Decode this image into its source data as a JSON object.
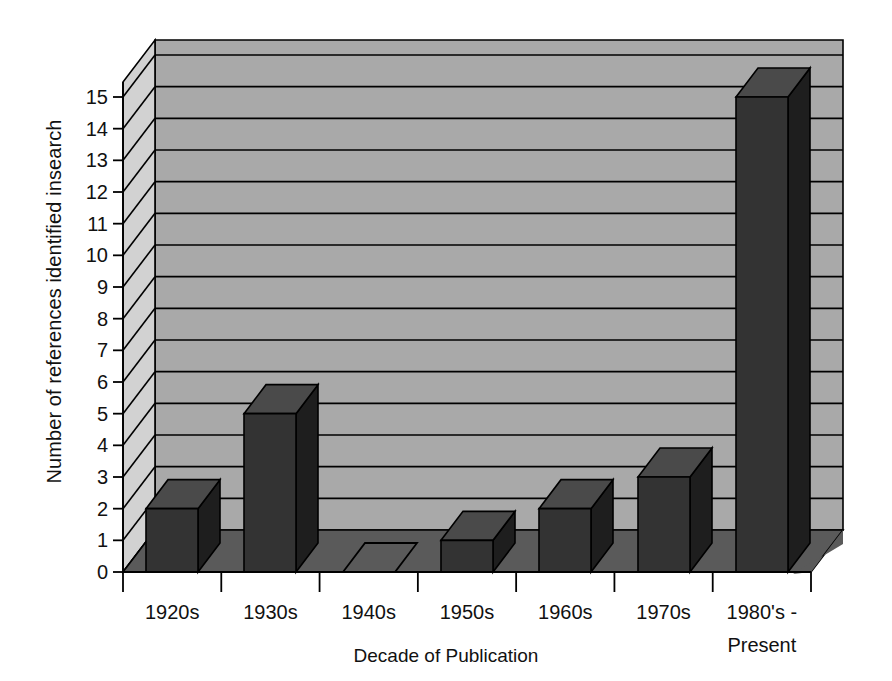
{
  "chart_data": {
    "type": "bar",
    "title": "",
    "subtitle": "",
    "xlabel": "Decade of Publication",
    "ylabel": "Number of references identified insearch",
    "categories": [
      "1920s",
      "1930s",
      "1940s",
      "1950s",
      "1960s",
      "1970s",
      "1980's - Present"
    ],
    "values": [
      2,
      5,
      0,
      1,
      2,
      3,
      15
    ],
    "ylim": [
      0,
      15
    ],
    "ytick_labels": [
      "0",
      "1",
      "2",
      "3",
      "4",
      "5",
      "6",
      "7",
      "8",
      "9",
      "10",
      "11",
      "12",
      "13",
      "14",
      "15"
    ],
    "ytick_values": [
      0,
      1,
      2,
      3,
      4,
      5,
      6,
      7,
      8,
      9,
      10,
      11,
      12,
      13,
      14,
      15
    ],
    "grid": true,
    "legend": false,
    "legend_position": "none",
    "style": "3d-column",
    "annotations": [
      "1940s column has value 0 and is drawn as a flat outline on the floor"
    ]
  },
  "axis": {
    "y_title": "Number of references identified insearch",
    "x_title": "Decade of Publication",
    "x_categories": [
      {
        "line1": "1920s",
        "line2": ""
      },
      {
        "line1": "1930s",
        "line2": ""
      },
      {
        "line1": "1940s",
        "line2": ""
      },
      {
        "line1": "1950s",
        "line2": ""
      },
      {
        "line1": "1960s",
        "line2": ""
      },
      {
        "line1": "1970s",
        "line2": ""
      },
      {
        "line1": "1980's -",
        "line2": "Present"
      }
    ]
  },
  "colors": {
    "background": "#ffffff",
    "back_wall": "#a9a9a9",
    "side_wall": "#d2d2d2",
    "floor": "#5a5a5a",
    "bar_front": "#333333",
    "bar_side": "#1e1e1e",
    "bar_top": "#4a4a4a",
    "gridline": "#000000",
    "text": "#111111"
  }
}
